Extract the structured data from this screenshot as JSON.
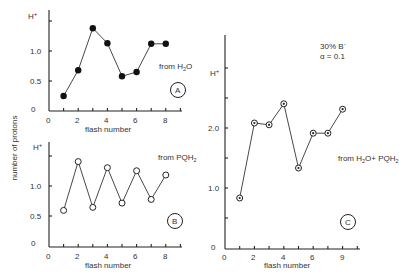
{
  "ylabel": "number of protons",
  "chart_data": [
    {
      "type": "line",
      "panel": "A",
      "title": "from H2O",
      "source_label": "from H",
      "source_sub": "2",
      "source_tail": "O",
      "xlabel": "flash number",
      "ylabel": "H+",
      "y_unit_label": "H",
      "y_unit_sup": "+",
      "x": [
        1,
        2,
        3,
        4,
        5,
        6,
        7,
        8
      ],
      "values": [
        0.25,
        0.68,
        1.38,
        1.13,
        0.58,
        0.65,
        1.12,
        1.12
      ],
      "marker": "filled-circle",
      "xticks": [
        "0",
        "2",
        "4",
        "6",
        "8"
      ],
      "yticks": [
        "0",
        "0.5",
        "1.0"
      ],
      "xlim": [
        0,
        9
      ],
      "ylim": [
        0,
        1.65
      ]
    },
    {
      "type": "line",
      "panel": "B",
      "title": "from PQH2",
      "source_label": "from PQH",
      "source_sub": "2",
      "xlabel": "flash number",
      "ylabel": "H+",
      "y_unit_label": "H",
      "y_unit_sup": "+",
      "x": [
        1,
        2,
        3,
        4,
        5,
        6,
        7,
        8
      ],
      "values": [
        0.6,
        1.4,
        0.65,
        1.3,
        0.72,
        1.25,
        0.78,
        1.18
      ],
      "marker": "open-circle",
      "xticks": [
        "0",
        "2",
        "4",
        "6",
        "8"
      ],
      "yticks": [
        "0",
        "0.5",
        "1.0"
      ],
      "xlim": [
        0,
        9
      ],
      "ylim": [
        0,
        1.65
      ]
    },
    {
      "type": "line",
      "panel": "C",
      "title": "from H2O+PQH2",
      "source_label": "from H",
      "source_sub": "2",
      "source_mid": "O+ PQH",
      "source_sub2": "2",
      "annotation_1": "30% B",
      "annotation_1_sup": "-",
      "annotation_2": "α = 0.1",
      "xlabel": "flash number",
      "ylabel": "H+",
      "y_unit_label": "H",
      "y_unit_sup": "+",
      "x": [
        1,
        2,
        3,
        4,
        5,
        6,
        7,
        8
      ],
      "values": [
        0.85,
        2.1,
        2.07,
        2.42,
        1.35,
        1.93,
        1.93,
        2.33
      ],
      "marker": "circle-dot",
      "xticks": [
        "0",
        "2",
        "4",
        "6",
        "9"
      ],
      "yticks": [
        "0",
        "1.0",
        "2.0"
      ],
      "xlim": [
        0,
        9
      ],
      "ylim": [
        0,
        3.6
      ]
    }
  ]
}
